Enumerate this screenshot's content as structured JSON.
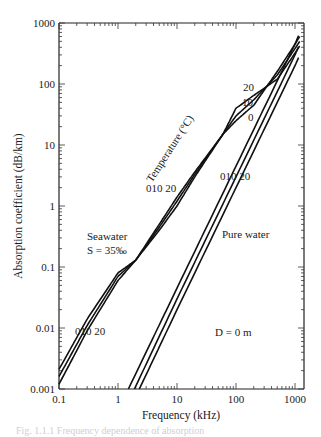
{
  "chart_data": {
    "type": "line",
    "title": "",
    "xlabel": "Frequency (kHz)",
    "ylabel": "Absorption coefficient (dB/km)",
    "xscale": "log",
    "yscale": "log",
    "xlim": [
      0.1,
      1300
    ],
    "ylim": [
      0.001,
      1000
    ],
    "x_ticks": [
      "0.1",
      "1",
      "10",
      "100",
      "1000"
    ],
    "y_ticks": [
      "0.001",
      "0.01",
      "0.1",
      "1",
      "10",
      "100",
      "1000"
    ],
    "grid": false,
    "legend": null,
    "series": [
      {
        "name": "Seawater S=35‰, T=0°C",
        "x": [
          0.1,
          0.3,
          1,
          2,
          5,
          10,
          20,
          60,
          100,
          200,
          500,
          1000,
          1200
        ],
        "y": [
          0.0012,
          0.009,
          0.06,
          0.13,
          0.4,
          1.0,
          3.0,
          15,
          25,
          45,
          160,
          450,
          600
        ]
      },
      {
        "name": "Seawater S=35‰, T=10°C",
        "x": [
          0.1,
          0.3,
          1,
          2,
          5,
          10,
          20,
          60,
          100,
          200,
          500,
          1000,
          1200
        ],
        "y": [
          0.0016,
          0.011,
          0.07,
          0.13,
          0.45,
          1.2,
          3.3,
          15,
          30,
          55,
          140,
          380,
          500
        ]
      },
      {
        "name": "Seawater S=35‰, T=20°C",
        "x": [
          0.1,
          0.3,
          1,
          2,
          5,
          10,
          20,
          60,
          100,
          200,
          500,
          1000,
          1200
        ],
        "y": [
          0.0021,
          0.014,
          0.08,
          0.13,
          0.5,
          1.4,
          3.6,
          15,
          40,
          65,
          120,
          320,
          420
        ]
      },
      {
        "name": "Pure water, T=0°C",
        "x": [
          1.5,
          10,
          100,
          1000,
          1150
        ],
        "y": [
          0.001,
          0.045,
          4.5,
          450,
          620
        ]
      },
      {
        "name": "Pure water, T=10°C",
        "x": [
          1.9,
          10,
          100,
          1000,
          1150
        ],
        "y": [
          0.001,
          0.03,
          3.0,
          300,
          410
        ]
      },
      {
        "name": "Pure water, T=20°C",
        "x": [
          2.3,
          10,
          100,
          1000,
          1150
        ],
        "y": [
          0.001,
          0.02,
          2.0,
          200,
          270
        ]
      }
    ],
    "annotations": [
      {
        "text": "Seawater",
        "x": 0.35,
        "y": 0.3
      },
      {
        "text": "S = 35‰",
        "x": 0.35,
        "y": 0.17
      },
      {
        "text": "Pure water",
        "x": 70,
        "y": 0.3
      },
      {
        "text": "Temperature (°C)",
        "x": 10,
        "y": 4,
        "rotation": -55
      },
      {
        "text": "0",
        "x": 0.3,
        "y": 0.009
      },
      {
        "text": "10",
        "x": 0.37,
        "y": 0.009
      },
      {
        "text": "20",
        "x": 0.5,
        "y": 0.009
      },
      {
        "text": "0",
        "x": 10,
        "y": 2
      },
      {
        "text": "10",
        "x": 12,
        "y": 2
      },
      {
        "text": "20",
        "x": 17,
        "y": 2
      },
      {
        "text": "0",
        "x": 60,
        "y": 2
      },
      {
        "text": "10",
        "x": 72,
        "y": 2
      },
      {
        "text": "20",
        "x": 100,
        "y": 2
      },
      {
        "text": "20",
        "x": 180,
        "y": 80
      },
      {
        "text": "10",
        "x": 190,
        "y": 45
      },
      {
        "text": "0",
        "x": 200,
        "y": 25
      },
      {
        "text": "D = 0 m",
        "x": 200,
        "y": 0.004
      }
    ]
  },
  "labels": {
    "xlabel": "Frequency (kHz)",
    "ylabel": "Absorption coefficient (dB/km)",
    "x_ticks": [
      "0.1",
      "1",
      "10",
      "100",
      "1000"
    ],
    "y_ticks": [
      "1000",
      "100",
      "10",
      "1",
      "0.1",
      "0.01",
      "0.001"
    ],
    "seawater": "Seawater",
    "salinity": "S = 35‰",
    "pure_water": "Pure water",
    "temperature": "Temperature (°C)",
    "depth": "D = 0 m",
    "sw_low_temps": "010 20",
    "sw_mid_temps": "010 20",
    "pw_temps": "010 20",
    "sw_high_20": "20",
    "sw_high_10": "10",
    "sw_high_0": "0",
    "caption": "Fig. 1.1.1  Frequency dependence of absorption"
  }
}
